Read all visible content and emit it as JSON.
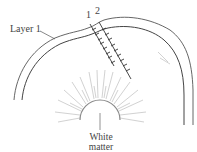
{
  "diagram": {
    "labels": {
      "layer1": "Layer 1",
      "penetration1": "1",
      "penetration2": "2",
      "white_matter_line1": "White",
      "white_matter_line2": "matter"
    },
    "elements": [
      {
        "id": "outer-cortex-surface",
        "type": "curve"
      },
      {
        "id": "layer1-boundary",
        "type": "curve"
      },
      {
        "id": "penetration-1",
        "type": "electrode-track"
      },
      {
        "id": "penetration-2",
        "type": "electrode-track"
      },
      {
        "id": "white-matter-region",
        "type": "radiating-fibers"
      }
    ],
    "colors": {
      "line": "#555555",
      "track": "#333333",
      "fibers": "#9a9a9a"
    }
  }
}
